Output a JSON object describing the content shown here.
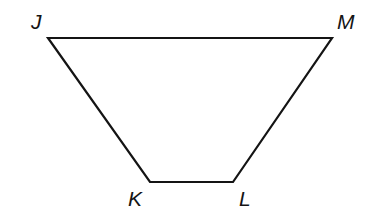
{
  "figure": {
    "kind": "geometry-diagram",
    "shape_name": "trapezoid",
    "shape_id": "JKLM",
    "background_color": "#ffffff",
    "stroke_color": "#141414",
    "stroke_width": 2.2,
    "fill_color": "none",
    "canvas": {
      "width": 378,
      "height": 216
    },
    "vertices": [
      {
        "id": "J",
        "label": "J",
        "x": 48,
        "y": 38,
        "label_x": 31,
        "label_y": 11
      },
      {
        "id": "M",
        "label": "M",
        "x": 332,
        "y": 38,
        "label_x": 337,
        "label_y": 11
      },
      {
        "id": "L",
        "label": "L",
        "x": 233,
        "y": 182,
        "label_x": 239,
        "label_y": 188
      },
      {
        "id": "K",
        "label": "K",
        "x": 150,
        "y": 182,
        "label_x": 128,
        "label_y": 188
      }
    ],
    "edges": [
      {
        "id": "JM",
        "from": "J",
        "to": "M",
        "name": "top-base"
      },
      {
        "id": "ML",
        "from": "M",
        "to": "L",
        "name": "right-leg"
      },
      {
        "id": "LK",
        "from": "L",
        "to": "K",
        "name": "bottom-base"
      },
      {
        "id": "KJ",
        "from": "K",
        "to": "J",
        "name": "left-leg"
      }
    ],
    "polygon_points": "48,38 332,38 233,182 150,182"
  }
}
